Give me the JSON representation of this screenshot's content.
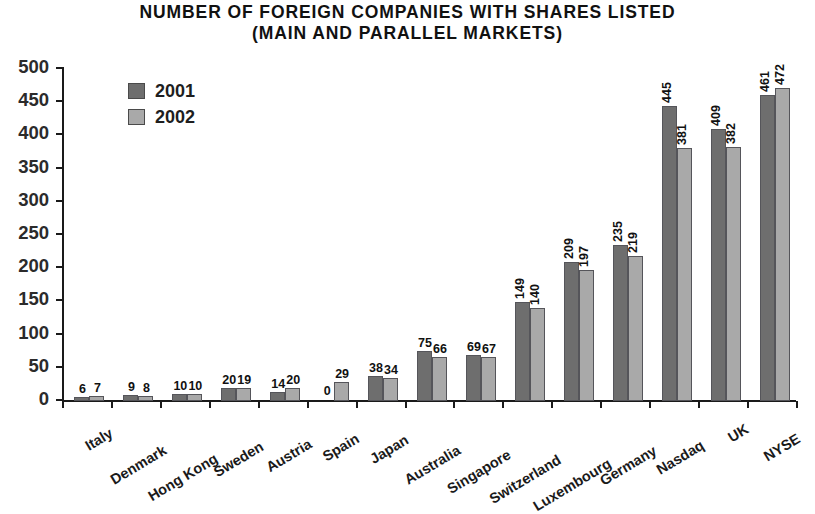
{
  "title": {
    "line1": "NUMBER OF FOREIGN COMPANIES WITH SHARES LISTED",
    "line2": "(MAIN AND PARALLEL MARKETS)"
  },
  "colors": {
    "series_2001": "#6e6e6e",
    "series_2002": "#a9a9a9",
    "bar_border": "#55555a",
    "axis": "#1a1a1a",
    "text": "#111111",
    "background": "#ffffff"
  },
  "chart_data": {
    "type": "bar",
    "title": "NUMBER OF FOREIGN COMPANIES WITH SHARES LISTED (MAIN AND PARALLEL MARKETS)",
    "xlabel": "",
    "ylabel": "",
    "ylim": [
      0,
      500
    ],
    "yticks": [
      0,
      50,
      100,
      150,
      200,
      250,
      300,
      350,
      400,
      450,
      500
    ],
    "grid": false,
    "legend_position": "top-left-inside",
    "categories": [
      "Italy",
      "Denmark",
      "Hong Kong",
      "Sweden",
      "Austria",
      "Spain",
      "Japan",
      "Australia",
      "Singapore",
      "Switzerland",
      "Luxembourg",
      "Germany",
      "Nasdaq",
      "UK",
      "NYSE"
    ],
    "series": [
      {
        "name": "2001",
        "color": "#6e6e6e",
        "values": [
          6,
          9,
          10,
          20,
          14,
          0,
          38,
          75,
          69,
          149,
          209,
          235,
          445,
          409,
          461
        ]
      },
      {
        "name": "2002",
        "color": "#a9a9a9",
        "values": [
          7,
          8,
          10,
          19,
          20,
          29,
          34,
          66,
          67,
          140,
          197,
          219,
          381,
          382,
          472
        ]
      }
    ]
  }
}
